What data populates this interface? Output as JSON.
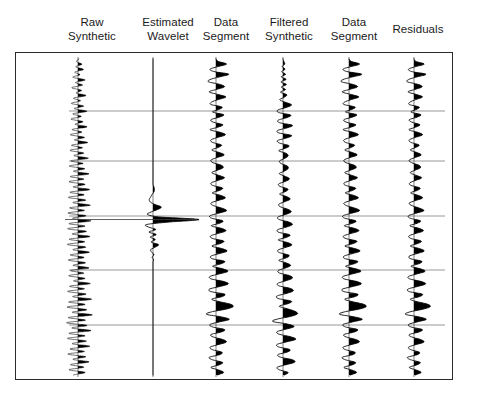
{
  "figure": {
    "title": "",
    "width": 482,
    "height": 401,
    "background": "#ffffff",
    "frame_color": "#2b2b2b",
    "gridline_color": "#8c8c8c",
    "trace_color": "#000000"
  },
  "headers": [
    {
      "name": "raw-synthetic",
      "line1": "Raw",
      "line2": "Synthetic",
      "cx": 92,
      "top": 16
    },
    {
      "name": "estimated-wavelet",
      "line1": "Estimated",
      "line2": "Wavelet",
      "cx": 168,
      "top": 16
    },
    {
      "name": "data-segment-1",
      "line1": "Data",
      "line2": "Segment",
      "cx": 226,
      "top": 16
    },
    {
      "name": "filtered-synthetic",
      "line1": "Filtered",
      "line2": "Synthetic",
      "cx": 289,
      "top": 16
    },
    {
      "name": "data-segment-2",
      "line1": "Data",
      "line2": "Segment",
      "cx": 354,
      "top": 16
    },
    {
      "name": "residuals",
      "line1": "Residuals",
      "line2": "",
      "cx": 418,
      "top": 23
    }
  ],
  "axis": {
    "name": "twt-axis",
    "unit_label_line1": "TWT",
    "unit_label_line2": "ms",
    "unit_label_x": 54,
    "unit_label_y": 185,
    "ticks": [
      {
        "label": "2000",
        "x": 62,
        "y": 154
      },
      {
        "label": "2300",
        "x": 62,
        "y": 316
      }
    ],
    "zero_marker": {
      "label": "0",
      "x": 97,
      "y": 129
    }
  },
  "plot": {
    "name": "seismic-plot-area",
    "left": 15,
    "top": 52,
    "width": 438,
    "height": 328,
    "gridlines_y": [
      110,
      160,
      215,
      269,
      324
    ],
    "grid_left": 68,
    "grid_right": 444
  },
  "chart_data": {
    "type": "line",
    "xlabel": "",
    "ylabel": "TWT ms",
    "ylim": [
      1880,
      2390
    ],
    "y_tick_labels": [
      "2000",
      "2300"
    ],
    "grid": true,
    "legend": "none",
    "plot_style": "variable-area wiggle (positive lobes filled black)",
    "trace_axis_x": [
      77,
      152,
      215,
      282,
      348,
      413
    ],
    "series": [
      {
        "name": "Raw Synthetic",
        "axis_x": 77,
        "gain": 13,
        "style": "dense-high-frequency-wiggle",
        "samples": [
          0.05,
          -0.12,
          0.3,
          -0.18,
          0.42,
          -0.25,
          0.15,
          -0.4,
          0.55,
          -0.2,
          0.35,
          -0.48,
          0.28,
          -0.15,
          0.62,
          -0.35,
          0.2,
          -0.52,
          0.44,
          -0.3,
          0.68,
          -0.4,
          0.25,
          -0.55,
          0.38,
          -0.22,
          0.7,
          -0.45,
          0.3,
          -0.6,
          0.5,
          -0.28,
          0.75,
          -0.5,
          0.35,
          -0.62,
          0.45,
          -0.32,
          0.8,
          -0.55,
          0.4,
          -0.68,
          0.52,
          -0.35,
          0.85,
          -0.6,
          0.45,
          -0.7,
          0.55,
          -0.38,
          0.9,
          -0.62,
          0.48,
          -0.75,
          0.6,
          -0.4,
          0.95,
          -0.65,
          0.5,
          -0.78,
          0.62,
          -0.42,
          1.0,
          -0.7,
          0.55,
          -0.8,
          0.65,
          -0.45,
          0.92,
          -0.68,
          0.52,
          -0.82,
          0.6,
          -0.4,
          0.88,
          -0.6,
          0.48,
          -0.75,
          0.58,
          -0.38,
          0.85,
          -0.58,
          0.45,
          -0.72,
          0.55,
          -0.35,
          0.95,
          -0.65,
          0.5,
          -0.8,
          0.62,
          -0.42,
          1.05,
          -0.72,
          0.55,
          -0.85,
          0.68,
          -0.45,
          1.1,
          -0.75,
          0.58,
          -0.88,
          0.7,
          -0.48,
          1.0,
          -0.7,
          0.55,
          -0.82,
          0.65,
          -0.45,
          0.92,
          -0.62,
          0.5,
          -0.78,
          0.6,
          -0.4,
          0.85,
          -0.58,
          0.45,
          -0.7,
          0.55,
          -0.35
        ]
      },
      {
        "name": "Estimated Wavelet",
        "axis_x": 152,
        "gain": 46,
        "style": "zero-phase-wavelet",
        "peak_time_index": 64,
        "samples": [
          0,
          0,
          0,
          0,
          0,
          0,
          0,
          0,
          0,
          0,
          0,
          0,
          0,
          0,
          0,
          0,
          0,
          0,
          0,
          0,
          0,
          0,
          0,
          0,
          0,
          0,
          0,
          0,
          0,
          0,
          0,
          0,
          0,
          0,
          0,
          0,
          0,
          0,
          0,
          0,
          0,
          0,
          0,
          0,
          0,
          0,
          0,
          0,
          0,
          0,
          0,
          0.02,
          0.03,
          0.02,
          -0.02,
          -0.05,
          -0.08,
          -0.06,
          0.04,
          0.18,
          0.1,
          -0.04,
          -0.12,
          0.15,
          1.0,
          0.35,
          -0.14,
          -0.1,
          0.06,
          -0.09,
          0.07,
          -0.06,
          0.05,
          -0.04,
          0.12,
          0.05,
          -0.05,
          -0.03,
          0.02,
          -0.02,
          0.01,
          0,
          0,
          0,
          0,
          0,
          0,
          0,
          0,
          0,
          0,
          0,
          0,
          0,
          0,
          0,
          0,
          0,
          0,
          0,
          0,
          0,
          0,
          0,
          0,
          0,
          0,
          0,
          0,
          0,
          0,
          0,
          0,
          0,
          0,
          0,
          0,
          0,
          0,
          0,
          0,
          0,
          0,
          0,
          0,
          0,
          0
        ]
      },
      {
        "name": "Data Segment",
        "axis_x": 215,
        "gain": 17,
        "style": "variable-area-wiggle",
        "samples": [
          0.0,
          0.15,
          0.62,
          0.12,
          -0.35,
          -0.1,
          0.75,
          0.25,
          -0.3,
          -0.45,
          0.2,
          0.5,
          0.05,
          -0.4,
          0.1,
          0.58,
          0.15,
          -0.25,
          -0.3,
          0.35,
          0.15,
          -0.2,
          0.45,
          0.2,
          -0.3,
          -0.15,
          0.4,
          0.1,
          -0.35,
          0.25,
          0.55,
          0.1,
          -0.3,
          -0.2,
          0.32,
          0.12,
          -0.25,
          0.2,
          0.48,
          0.05,
          -0.3,
          -0.18,
          0.3,
          0.42,
          0.08,
          -0.25,
          0.15,
          0.5,
          0.12,
          -0.28,
          -0.2,
          0.38,
          0.2,
          -0.22,
          0.3,
          0.55,
          0.1,
          -0.3,
          -0.15,
          0.35,
          0.62,
          0.15,
          -0.35,
          -0.25,
          0.4,
          0.2,
          -0.28,
          0.32,
          0.58,
          0.12,
          -0.32,
          -0.2,
          0.45,
          0.25,
          -0.25,
          0.35,
          0.65,
          0.18,
          -0.3,
          -0.22,
          0.5,
          0.3,
          -0.2,
          0.4,
          0.7,
          0.2,
          -0.35,
          -0.28,
          0.45,
          0.72,
          0.22,
          -0.38,
          -0.3,
          0.5,
          0.35,
          -0.25,
          0.2,
          0.85,
          1.0,
          0.55,
          -0.25,
          -0.55,
          0.3,
          0.78,
          0.2,
          -0.35,
          -0.2,
          0.5,
          0.3,
          -0.3,
          -0.15,
          0.42,
          0.6,
          0.12,
          -0.35,
          -0.2,
          0.35,
          0.2,
          -0.4,
          -0.2,
          0.38,
          0.18,
          -0.3,
          0.15,
          0.45,
          0.1
        ]
      },
      {
        "name": "Filtered Synthetic",
        "axis_x": 282,
        "gain": 17,
        "style": "variable-area-wiggle",
        "samples": [
          0.0,
          0.05,
          0.1,
          -0.05,
          0.12,
          -0.08,
          0.15,
          -0.1,
          0.18,
          -0.12,
          0.2,
          -0.1,
          0.15,
          -0.15,
          0.22,
          0.08,
          -0.2,
          0.15,
          0.5,
          0.2,
          -0.3,
          -0.25,
          0.45,
          0.22,
          -0.28,
          -0.2,
          0.55,
          0.25,
          -0.3,
          -0.25,
          0.5,
          0.2,
          -0.32,
          -0.2,
          0.35,
          0.15,
          -0.25,
          0.18,
          0.3,
          0.1,
          -0.2,
          -0.12,
          0.25,
          0.3,
          0.08,
          -0.22,
          0.12,
          0.38,
          0.15,
          -0.25,
          -0.18,
          0.28,
          0.15,
          -0.2,
          0.22,
          0.42,
          0.1,
          -0.25,
          -0.15,
          0.3,
          0.48,
          0.15,
          -0.3,
          -0.22,
          0.35,
          0.55,
          0.18,
          -0.32,
          -0.25,
          0.4,
          0.2,
          -0.28,
          0.25,
          0.52,
          0.12,
          -0.3,
          -0.2,
          0.35,
          0.2,
          -0.25,
          0.18,
          0.45,
          0.15,
          -0.28,
          -0.2,
          0.38,
          0.55,
          0.18,
          -0.3,
          -0.25,
          0.42,
          0.6,
          0.2,
          -0.35,
          -0.28,
          0.48,
          0.3,
          -0.22,
          0.25,
          0.7,
          0.85,
          0.45,
          -0.3,
          -0.6,
          0.25,
          0.65,
          0.18,
          -0.35,
          -0.22,
          0.45,
          0.75,
          0.2,
          -0.35,
          -0.25,
          0.4,
          0.25,
          -0.3,
          -0.15,
          0.55,
          0.68,
          0.15,
          -0.35,
          -0.2,
          0.3,
          0.1
        ]
      },
      {
        "name": "Data Segment",
        "axis_x": 348,
        "gain": 17,
        "style": "variable-area-wiggle",
        "samples": [
          0.0,
          0.15,
          0.62,
          0.12,
          -0.35,
          -0.1,
          0.75,
          0.25,
          -0.3,
          -0.45,
          0.2,
          0.5,
          0.05,
          -0.4,
          0.1,
          0.58,
          0.15,
          -0.25,
          -0.3,
          0.35,
          0.15,
          -0.2,
          0.45,
          0.2,
          -0.3,
          -0.15,
          0.4,
          0.1,
          -0.35,
          0.25,
          0.55,
          0.1,
          -0.3,
          -0.2,
          0.32,
          0.12,
          -0.25,
          0.2,
          0.48,
          0.05,
          -0.3,
          -0.18,
          0.3,
          0.42,
          0.08,
          -0.25,
          0.15,
          0.5,
          0.12,
          -0.28,
          -0.2,
          0.38,
          0.2,
          -0.22,
          0.3,
          0.55,
          0.1,
          -0.3,
          -0.15,
          0.35,
          0.62,
          0.15,
          -0.35,
          -0.25,
          0.4,
          0.2,
          -0.28,
          0.32,
          0.58,
          0.12,
          -0.32,
          -0.2,
          0.45,
          0.25,
          -0.25,
          0.35,
          0.65,
          0.18,
          -0.3,
          -0.22,
          0.5,
          0.3,
          -0.2,
          0.4,
          0.7,
          0.2,
          -0.35,
          -0.28,
          0.45,
          0.72,
          0.22,
          -0.38,
          -0.3,
          0.5,
          0.35,
          -0.25,
          0.2,
          0.85,
          1.0,
          0.55,
          -0.25,
          -0.55,
          0.3,
          0.78,
          0.2,
          -0.35,
          -0.2,
          0.5,
          0.3,
          -0.3,
          -0.15,
          0.42,
          0.6,
          0.12,
          -0.35,
          -0.2,
          0.35,
          0.2,
          -0.4,
          -0.2,
          0.38,
          0.18,
          -0.3,
          0.15,
          0.45,
          0.1
        ]
      },
      {
        "name": "Residuals",
        "axis_x": 413,
        "gain": 17,
        "style": "variable-area-wiggle",
        "samples": [
          0.0,
          0.12,
          0.6,
          0.1,
          -0.32,
          -0.12,
          0.7,
          0.22,
          -0.28,
          -0.4,
          0.22,
          0.48,
          0.08,
          -0.35,
          0.12,
          0.5,
          0.12,
          -0.22,
          -0.28,
          0.3,
          0.12,
          -0.18,
          0.4,
          0.18,
          -0.28,
          -0.12,
          0.35,
          0.08,
          -0.3,
          0.22,
          0.5,
          0.08,
          -0.28,
          -0.18,
          0.3,
          0.1,
          -0.22,
          0.18,
          0.42,
          0.05,
          -0.28,
          -0.15,
          0.28,
          0.38,
          0.06,
          -0.22,
          0.12,
          0.45,
          0.1,
          -0.25,
          -0.18,
          0.35,
          0.18,
          -0.2,
          0.28,
          0.5,
          0.08,
          -0.28,
          -0.12,
          0.32,
          0.58,
          0.12,
          -0.32,
          -0.22,
          0.38,
          0.18,
          -0.25,
          0.3,
          0.55,
          0.1,
          -0.3,
          -0.18,
          0.42,
          0.22,
          -0.22,
          0.32,
          0.6,
          0.15,
          -0.28,
          -0.2,
          0.45,
          0.28,
          -0.18,
          0.38,
          0.65,
          0.18,
          -0.32,
          -0.25,
          0.42,
          0.68,
          0.2,
          -0.35,
          -0.28,
          0.48,
          0.32,
          -0.22,
          0.18,
          0.8,
          0.95,
          0.5,
          -0.22,
          -0.5,
          0.28,
          0.72,
          0.18,
          -0.32,
          -0.18,
          0.48,
          0.28,
          -0.28,
          -0.12,
          0.4,
          0.58,
          0.1,
          -0.32,
          -0.18,
          0.32,
          0.18,
          -0.38,
          -0.18,
          0.36,
          0.16,
          -0.28,
          0.12,
          0.42,
          0.08
        ]
      }
    ]
  }
}
